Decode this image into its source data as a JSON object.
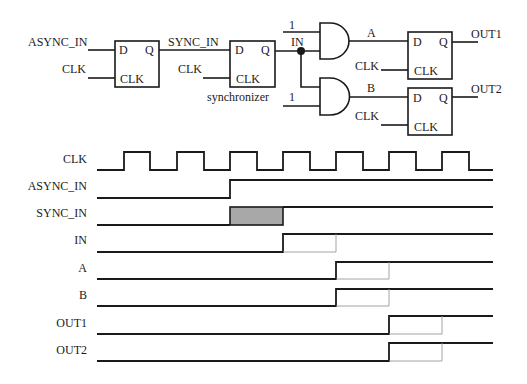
{
  "circuit": {
    "ff1": {
      "d": "D",
      "q": "Q",
      "clk": "CLK",
      "in_label": "ASYNC_IN",
      "clk_label": "CLK"
    },
    "ff2": {
      "d": "D",
      "q": "Q",
      "clk": "CLK",
      "in_label": "SYNC_IN",
      "clk_label": "CLK",
      "caption": "synchronizer"
    },
    "node_label": "IN",
    "gate_a": {
      "const_input": "1",
      "output_label": "A"
    },
    "gate_b": {
      "const_input": "1",
      "output_label": "B"
    },
    "ff3": {
      "d": "D",
      "q": "Q",
      "clk": "CLK",
      "clk_label": "CLK",
      "out_label": "OUT1"
    },
    "ff4": {
      "d": "D",
      "q": "Q",
      "clk": "CLK",
      "clk_label": "CLK",
      "out_label": "OUT2"
    }
  },
  "timing": {
    "signals": [
      {
        "name": "CLK"
      },
      {
        "name": "ASYNC_IN"
      },
      {
        "name": "SYNC_IN"
      },
      {
        "name": "IN"
      },
      {
        "name": "A"
      },
      {
        "name": "B"
      },
      {
        "name": "OUT1"
      },
      {
        "name": "OUT2"
      }
    ],
    "colors": {
      "line": "#1a1a1a",
      "metastable_fill": "#a8a8a8",
      "ghost": "#9a9a9a"
    }
  }
}
